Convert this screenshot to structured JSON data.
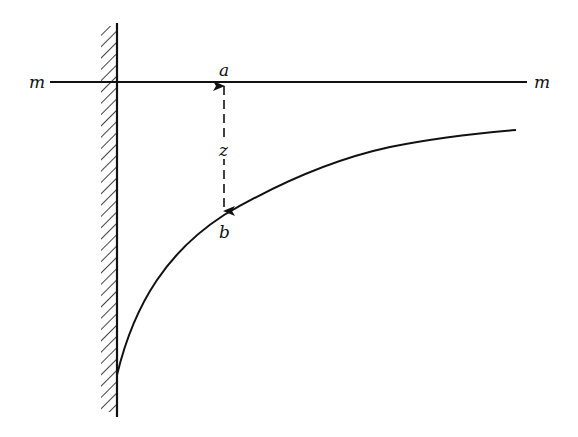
{
  "diagram": {
    "type": "free-surface profile near a wall",
    "labels": {
      "line_left": "m",
      "line_right": "m",
      "point_top": "a",
      "point_bottom": "b",
      "distance": "z"
    },
    "colors": {
      "ink": "#111111",
      "background": "#ffffff"
    }
  }
}
